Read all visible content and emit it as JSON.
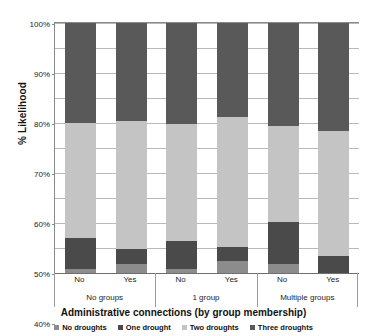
{
  "chart_data": {
    "type": "bar",
    "stacked": true,
    "title": "",
    "xlabel": "Administrative  connections (by group membership)",
    "ylabel": "% Likelihood",
    "ylim": [
      0,
      100
    ],
    "ytick_labels": [
      "0%",
      "10%",
      "20%",
      "30%",
      "40%",
      "50%",
      "60%",
      "70%",
      "80%",
      "90%",
      "100%"
    ],
    "ytick_values": [
      0,
      10,
      20,
      30,
      40,
      50,
      60,
      70,
      80,
      90,
      100
    ],
    "grid": true,
    "legend_position": "bottom",
    "categories": [
      "No",
      "Yes",
      "No",
      "Yes",
      "No",
      "Yes"
    ],
    "group_labels": [
      "No groups",
      "1 group",
      "Multiple groups"
    ],
    "series": [
      {
        "name": "No droughts",
        "color": "#8c8c8c",
        "values": [
          1.5,
          3.5,
          1.5,
          5.0,
          3.5,
          0.0
        ]
      },
      {
        "name": "One drought",
        "color": "#4a4a4a",
        "values": [
          12.5,
          6.0,
          11.5,
          5.5,
          17.0,
          7.0
        ]
      },
      {
        "name": "Two droughts",
        "color": "#c4c4c4",
        "values": [
          46.0,
          51.5,
          46.5,
          52.0,
          38.5,
          50.0
        ]
      },
      {
        "name": "Three droughts",
        "color": "#595959",
        "values": [
          40.0,
          39.0,
          40.5,
          37.5,
          41.0,
          43.0
        ]
      }
    ]
  },
  "colors": {
    "no_droughts": "#8c8c8c",
    "one_drought": "#4a4a4a",
    "two_droughts": "#c4c4c4",
    "three_droughts": "#595959",
    "gridline": "#b9b9b9",
    "axis": "#8a8a8a",
    "text": "#1c1c1c"
  }
}
